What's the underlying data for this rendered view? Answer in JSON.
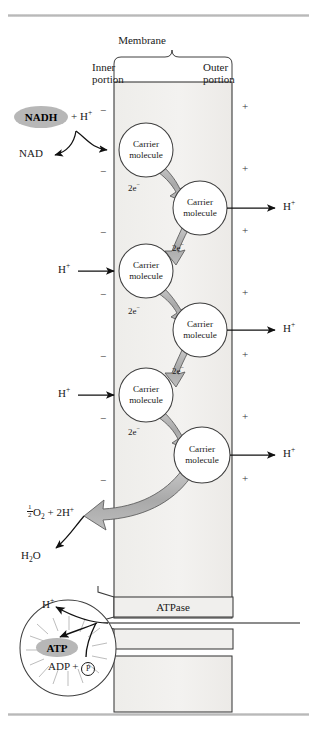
{
  "figure": {
    "title_labels": {
      "membrane": "Membrane",
      "inner_portion_line1": "Inner",
      "inner_portion_line2": "portion",
      "outer_portion_line1": "Outer",
      "outer_portion_line2": "portion"
    },
    "membrane_box": {
      "fill_color": "#f0efed",
      "stroke_color": "#3a3a3a",
      "x": 114,
      "y": 82,
      "width": 118,
      "height": 536
    },
    "inner_side_signs": [
      "−",
      "−",
      "−",
      "−",
      "−",
      "−",
      "−"
    ],
    "outer_side_signs": [
      "+",
      "+",
      "+",
      "+",
      "+",
      "+",
      "+"
    ],
    "donor": {
      "nadh_label": "NADH",
      "nadh_plus_h": "+ H",
      "nadh_plus_h_sup": "+",
      "nadh_fill": "#b7b7b7",
      "nad_label": "NAD"
    },
    "carriers": [
      {
        "line1": "Carrier",
        "line2": "molecule",
        "cx": 146,
        "cy": 150,
        "r": 27
      },
      {
        "line1": "Carrier",
        "line2": "molecule",
        "cx": 200,
        "cy": 208,
        "r": 27
      },
      {
        "line1": "Carrier",
        "line2": "molecule",
        "cx": 146,
        "cy": 271,
        "r": 27
      },
      {
        "line1": "Carrier",
        "line2": "molecule",
        "cx": 200,
        "cy": 330,
        "r": 27
      },
      {
        "line1": "Carrier",
        "line2": "molecule",
        "cx": 146,
        "cy": 395,
        "r": 27
      },
      {
        "line1": "Carrier",
        "line2": "molecule",
        "cx": 202,
        "cy": 455,
        "r": 28
      }
    ],
    "electron_labels": [
      {
        "text": "2e",
        "sup": "−",
        "x": 128,
        "y": 183
      },
      {
        "text": "2e",
        "sup": "−",
        "x": 172,
        "y": 243
      },
      {
        "text": "2e",
        "sup": "−",
        "x": 128,
        "y": 306
      },
      {
        "text": "2e",
        "sup": "−",
        "x": 172,
        "y": 366
      },
      {
        "text": "2e",
        "sup": "−",
        "x": 128,
        "y": 427
      }
    ],
    "proton_in_labels": [
      {
        "text": "H",
        "sup": "+",
        "x": 60,
        "y": 264
      },
      {
        "text": "H",
        "sup": "+",
        "x": 60,
        "y": 388
      }
    ],
    "proton_out_labels": [
      {
        "text": "H",
        "sup": "+",
        "x": 282,
        "y": 202
      },
      {
        "text": "H",
        "sup": "+",
        "x": 282,
        "y": 324
      },
      {
        "text": "H",
        "sup": "+",
        "x": 282,
        "y": 449
      }
    ],
    "oxygen_reaction": {
      "frac_num": "1",
      "frac_den": "2",
      "o2": "O",
      "o2_sub": "2",
      "plus": " + 2H",
      "plus_sup": "+",
      "water": "H",
      "water_sub": "2",
      "water_o": "O"
    },
    "atpase": {
      "label": "ATPase",
      "proton_label": "H",
      "proton_sup": "+",
      "atp_label": "ATP",
      "atp_fill": "#b7b7b7",
      "adp_label": "ADP + ",
      "phosphate_label": "P"
    },
    "colors": {
      "arrow_fill": "#b0b0b0",
      "arrow_stroke": "#4a4a4a",
      "rule_gray": "#c2c2c2",
      "membrane_fill": "#f0efed",
      "line": "#1a1a1a"
    }
  }
}
